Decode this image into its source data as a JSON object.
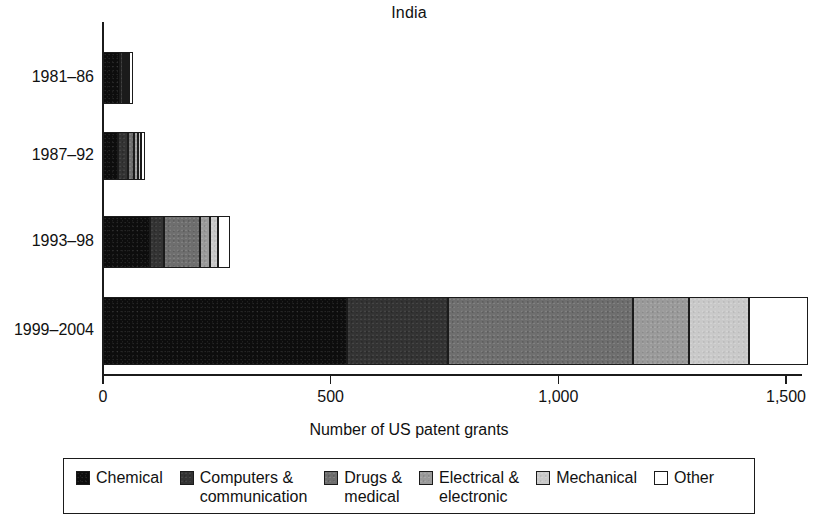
{
  "chart_data": {
    "type": "bar",
    "subtype": "stacked-horizontal",
    "title": "India",
    "xlabel": "Number of US patent grants",
    "ylabel": "",
    "categories": [
      "1981–86",
      "1987–92",
      "1993–98",
      "1999–2004"
    ],
    "xlim": [
      0,
      1500
    ],
    "xticks": [
      0,
      500,
      1000,
      1500
    ],
    "xtick_labels": [
      "0",
      "500",
      "1,000",
      "1,500"
    ],
    "grid": false,
    "legend_position": "bottom",
    "series": [
      {
        "name": "Chemical",
        "color": "#0d0d0d",
        "values": [
          37,
          33,
          103,
          536
        ]
      },
      {
        "name": "Computers &\ncommunication",
        "color": "#333333",
        "values": [
          6,
          22,
          31,
          221
        ]
      },
      {
        "name": "Drugs &\nmedical",
        "color": "#6e6e6e",
        "values": [
          5,
          13,
          79,
          406
        ]
      },
      {
        "name": "Electrical &\nelectronic",
        "color": "#9a9a9a",
        "values": [
          5,
          9,
          22,
          125
        ]
      },
      {
        "name": "Mechanical",
        "color": "#c9c9c9",
        "values": [
          5,
          7,
          18,
          130
        ]
      },
      {
        "name": "Other",
        "color": "#ffffff",
        "values": [
          8,
          9,
          26,
          130
        ]
      }
    ],
    "totals": [
      66,
      93,
      279,
      1548
    ]
  },
  "legend": {
    "items": [
      {
        "label": "Chemical",
        "swatch": "chemical-swatch"
      },
      {
        "label": "Computers &\ncommunication",
        "swatch": "computers-communication-swatch"
      },
      {
        "label": "Drugs &\nmedical",
        "swatch": "drugs-medical-swatch"
      },
      {
        "label": "Electrical &\nelectronic",
        "swatch": "electrical-electronic-swatch"
      },
      {
        "label": "Mechanical",
        "swatch": "mechanical-swatch"
      },
      {
        "label": "Other",
        "swatch": "other-swatch"
      }
    ]
  }
}
